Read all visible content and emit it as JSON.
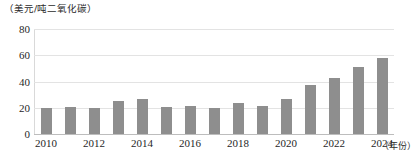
{
  "chart_data": {
    "type": "bar",
    "title": "",
    "ylabel": "（美元/吨二氧化碳）",
    "xlabel": "（年份）",
    "ylim": [
      0,
      80
    ],
    "yticks": [
      0,
      20,
      40,
      60,
      80
    ],
    "grid": true,
    "legend": "none",
    "bar_color": "#8e8e8e",
    "gridline_color": "#e3e3e3",
    "categories": [
      "2010",
      "2011",
      "2012",
      "2013",
      "2014",
      "2015",
      "2016",
      "2017",
      "2018",
      "2019",
      "2020",
      "2021",
      "2022",
      "2023",
      "2024"
    ],
    "tick_categories": [
      "2010",
      "2012",
      "2014",
      "2016",
      "2018",
      "2020",
      "2022",
      "2024"
    ],
    "values": [
      20,
      20.5,
      19.5,
      25,
      26.5,
      20.5,
      21,
      20,
      23.5,
      21,
      26.5,
      37.5,
      43,
      51,
      58
    ]
  }
}
